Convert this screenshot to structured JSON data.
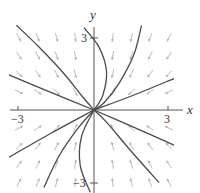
{
  "chart_data": {
    "type": "line",
    "title": "",
    "subtitle": "Phase portrait / direction field (stable node at origin)",
    "xlabel": "x",
    "ylabel": "y",
    "xlim": [
      -3.4,
      3.5
    ],
    "ylim": [
      -3.4,
      3.5
    ],
    "x_ticks": [
      {
        "value": -3,
        "label": "−3"
      },
      {
        "value": 3,
        "label": "3"
      }
    ],
    "y_ticks": [
      {
        "value": 3,
        "label": "3"
      },
      {
        "value": -3,
        "label": "−3"
      }
    ],
    "grid": false,
    "legend": null,
    "direction_field": {
      "description": "light gray arrows pointing toward the origin",
      "color": "#b4b4b4",
      "grid_x": [
        -3,
        -2.25,
        -1.5,
        -0.75,
        0.75,
        1.5,
        2.25,
        3
      ],
      "grid_y": [
        -3,
        -2.25,
        -1.5,
        -0.75,
        0.75,
        1.5,
        2.25,
        3
      ]
    },
    "trajectories": [
      {
        "name": "upper-left curve",
        "points": [
          [
            -3.1,
            3.5
          ],
          [
            -2.2,
            2.6
          ],
          [
            -1.2,
            1.5
          ],
          [
            -0.5,
            0.6
          ],
          [
            0,
            0
          ]
        ]
      },
      {
        "name": "upper-left line",
        "points": [
          [
            -3.4,
            1.45
          ],
          [
            -1.7,
            0.72
          ],
          [
            0,
            0
          ]
        ]
      },
      {
        "name": "upper-right curve",
        "points": [
          [
            1.9,
            3.5
          ],
          [
            1.6,
            2.3
          ],
          [
            1.0,
            1.1
          ],
          [
            0.4,
            0.3
          ],
          [
            0,
            0
          ]
        ]
      },
      {
        "name": "upper-right line",
        "points": [
          [
            3.2,
            1.3
          ],
          [
            1.6,
            0.62
          ],
          [
            0,
            0
          ]
        ]
      },
      {
        "name": "near-y-axis upper curve",
        "points": [
          [
            -0.4,
            3.4
          ],
          [
            0.2,
            2.6
          ],
          [
            0.5,
            1.6
          ],
          [
            0.35,
            0.6
          ],
          [
            0,
            0
          ]
        ]
      },
      {
        "name": "lower-left line",
        "points": [
          [
            -3.4,
            -1.95
          ],
          [
            -1.7,
            -0.95
          ],
          [
            0,
            0
          ]
        ]
      },
      {
        "name": "lower-left curve",
        "points": [
          [
            -2.0,
            -3.2
          ],
          [
            -1.4,
            -1.9
          ],
          [
            -0.6,
            -0.7
          ],
          [
            0,
            0
          ]
        ]
      },
      {
        "name": "near-y-axis lower curve",
        "points": [
          [
            -0.15,
            -3.4
          ],
          [
            -0.55,
            -2.3
          ],
          [
            -0.5,
            -1.1
          ],
          [
            0,
            0
          ]
        ]
      },
      {
        "name": "lower-right line",
        "points": [
          [
            3.2,
            -1.45
          ],
          [
            1.6,
            -0.72
          ],
          [
            0,
            0
          ]
        ]
      },
      {
        "name": "lower-right curve",
        "points": [
          [
            2.6,
            -3.0
          ],
          [
            1.4,
            -1.6
          ],
          [
            0.5,
            -0.5
          ],
          [
            0,
            0
          ]
        ]
      }
    ],
    "colors": {
      "trajectory": "#4a4a4a",
      "axis": "#555555",
      "arrow": "#b4b4b4"
    }
  },
  "labels": {
    "x_axis": "x",
    "y_axis": "y",
    "x_tick_neg": "−3",
    "x_tick_pos": "3",
    "y_tick_pos": "3",
    "y_tick_neg": "−3"
  }
}
